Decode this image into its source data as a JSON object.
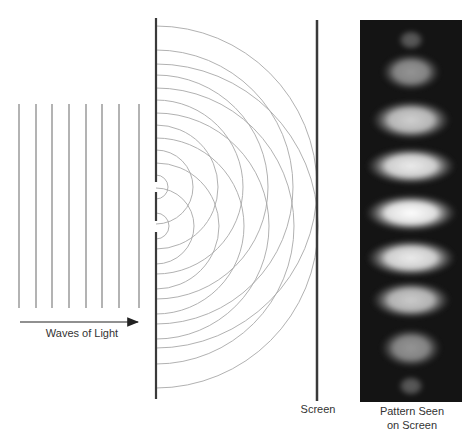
{
  "labels": {
    "waves": "Waves of Light",
    "screen": "Screen",
    "pattern_line1": "Pattern Seen",
    "pattern_line2": "on Screen"
  },
  "colors": {
    "wave_line": "#8a8a8a",
    "barrier": "#3a3a3a",
    "arc": "#a8a8a8",
    "arrow": "#222222",
    "panel_bg": "#141414",
    "fringe": "#f4f4f4"
  },
  "incoming_waves": {
    "x": [
      19,
      36,
      52,
      69,
      86,
      102,
      119,
      139
    ],
    "y_top": 104,
    "y_bottom": 308
  },
  "arrow": {
    "x1": 20,
    "x2": 138,
    "y": 322
  },
  "barrier": {
    "x": 156,
    "segments": [
      [
        18,
        182
      ],
      [
        192,
        221
      ],
      [
        232,
        399
      ]
    ]
  },
  "slits": [
    {
      "cy": 187,
      "radii": [
        12,
        37,
        62,
        87,
        112,
        137,
        161
      ]
    },
    {
      "cy": 226,
      "radii": [
        13,
        38,
        63,
        88,
        113,
        138,
        162
      ]
    }
  ],
  "screen_line": {
    "x": 317,
    "y_top": 20,
    "y_bottom": 401
  },
  "pattern_panel": {
    "x": 360,
    "y": 20,
    "width": 102,
    "height": 382,
    "fringes": [
      {
        "cy": 40,
        "rx": 14,
        "ry": 11,
        "intensity": 0.3
      },
      {
        "cy": 72,
        "rx": 30,
        "ry": 19,
        "intensity": 0.55
      },
      {
        "cy": 120,
        "rx": 40,
        "ry": 20,
        "intensity": 0.8
      },
      {
        "cy": 166,
        "rx": 45,
        "ry": 19,
        "intensity": 0.92
      },
      {
        "cy": 213,
        "rx": 46,
        "ry": 19,
        "intensity": 1.0
      },
      {
        "cy": 258,
        "rx": 45,
        "ry": 19,
        "intensity": 0.92
      },
      {
        "cy": 300,
        "rx": 40,
        "ry": 19,
        "intensity": 0.78
      },
      {
        "cy": 348,
        "rx": 31,
        "ry": 20,
        "intensity": 0.55
      },
      {
        "cy": 386,
        "rx": 14,
        "ry": 11,
        "intensity": 0.3
      }
    ]
  }
}
